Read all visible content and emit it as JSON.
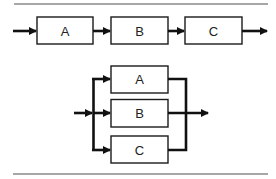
{
  "diagram": {
    "type": "block-diagram",
    "series_configuration": {
      "title": "",
      "blocks": [
        {
          "id": "A",
          "label": "A"
        },
        {
          "id": "B",
          "label": "B"
        },
        {
          "id": "C",
          "label": "C"
        }
      ],
      "connections": [
        "input->A",
        "A->B",
        "B->C",
        "C->output"
      ]
    },
    "parallel_configuration": {
      "title": "",
      "blocks": [
        {
          "id": "A",
          "label": "A"
        },
        {
          "id": "B",
          "label": "B"
        },
        {
          "id": "C",
          "label": "C"
        }
      ],
      "connections": [
        "input->split",
        "split->A",
        "split->B",
        "split->C",
        "A->join",
        "B->join",
        "C->join",
        "join->output"
      ]
    },
    "colors": {
      "line": "#111111",
      "box_border": "#1a1a1a",
      "rule": "#8a8a8a",
      "background": "#ffffff"
    }
  }
}
